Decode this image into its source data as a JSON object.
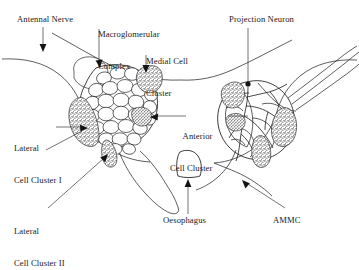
{
  "figure": {
    "background_color": "#ffffff",
    "ink_color": "#1a1a1a",
    "width": 359,
    "height": 242
  },
  "labels": {
    "antennal_nerve": "Antennal Nerve",
    "macroglomerular_complex_line1": "Macroglomerular",
    "macroglomerular_complex_line2": "Complex",
    "medial_cell_cluster_line1": "Medial Cell",
    "medial_cell_cluster_line2": "Cluster",
    "projection_neuron": "Projection Neuron",
    "anterior_cell_cluster_line1": "Anterior",
    "anterior_cell_cluster_line2": "Cell Cluster",
    "lateral_cell_cluster_i_line1": "Lateral",
    "lateral_cell_cluster_i_line2": "Cell Cluster I",
    "lateral_cell_cluster_ii_line1": "Lateral",
    "lateral_cell_cluster_ii_line2": "Cell Cluster II",
    "oesophagus": "Oesophagus",
    "ammc": "AMMC"
  },
  "structures": [
    {
      "name": "left-antennal-lobe",
      "description": "glomerular neuropil, left hemisphere"
    },
    {
      "name": "right-antennal-lobe",
      "description": "projection neuron arborisation, right hemisphere"
    },
    {
      "name": "oesophagus-foramen",
      "description": "median rounded opening"
    },
    {
      "name": "macroglomerular-complex",
      "description": "enlarged anterior glomerulus"
    },
    {
      "name": "medial-cell-cluster",
      "description": "stippled somata cluster, medial"
    },
    {
      "name": "lateral-cell-cluster-i",
      "description": "stippled somata cluster, lateral upper"
    },
    {
      "name": "lateral-cell-cluster-ii",
      "description": "stippled somata cluster, lateral lower"
    },
    {
      "name": "anterior-cell-cluster",
      "description": "stippled somata cluster, anterior"
    },
    {
      "name": "ammc",
      "description": "antennal mechanosensory and motor centre"
    }
  ]
}
